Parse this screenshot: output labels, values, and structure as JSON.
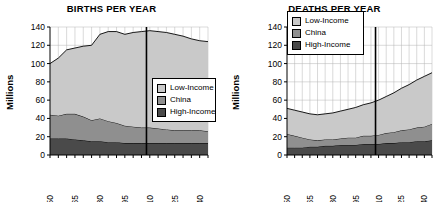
{
  "figure": {
    "width": 446,
    "height": 202,
    "background": "#ffffff"
  },
  "colors": {
    "low_income": "#c9c9c9",
    "china": "#8f8f8f",
    "high_income": "#4a4a4a",
    "axis": "#000000",
    "grid": "#b4b4b4",
    "marker_line": "#000000"
  },
  "chart_data": [
    {
      "type": "area",
      "stacked": true,
      "id": "births",
      "title": "BIRTHS PER YEAR",
      "xlabel": "",
      "ylabel": "Millions",
      "ylim": [
        0,
        140
      ],
      "yticks": [
        0,
        20,
        40,
        60,
        80,
        100,
        120,
        140
      ],
      "ytick_labels": [
        "0",
        "20",
        "40",
        "60",
        "80",
        "100",
        "120",
        "140"
      ],
      "xlim": [
        1950,
        2045
      ],
      "xticks": [
        1950,
        1965,
        1980,
        1995,
        2010,
        2025,
        2040
      ],
      "xtick_labels": [
        "1950",
        "1965",
        "1980",
        "1995",
        "2010",
        "2025",
        "2040"
      ],
      "minor_xtick_step": 5,
      "grid": true,
      "legend_position": "center-right",
      "marker_line_x": 2008,
      "x": [
        1950,
        1955,
        1960,
        1965,
        1970,
        1975,
        1980,
        1985,
        1990,
        1995,
        2000,
        2005,
        2010,
        2015,
        2020,
        2025,
        2030,
        2035,
        2040,
        2045
      ],
      "series": [
        {
          "name": "High-Income",
          "color": "#4a4a4a",
          "values": [
            18,
            18,
            18,
            17,
            16,
            15,
            15,
            14,
            14,
            13,
            13,
            13,
            13,
            13,
            13,
            13,
            13,
            13,
            13,
            13
          ]
        },
        {
          "name": "China",
          "color": "#8f8f8f",
          "values": [
            26,
            25,
            27,
            28,
            26,
            23,
            25,
            23,
            21,
            19,
            18,
            17,
            17,
            16,
            15,
            14,
            14,
            14,
            14,
            13
          ]
        },
        {
          "name": "Low-Income",
          "color": "#c9c9c9",
          "values": [
            56,
            63,
            70,
            72,
            77,
            82,
            92,
            98,
            100,
            100,
            103,
            105,
            106,
            106,
            106,
            105,
            103,
            100,
            98,
            98
          ]
        }
      ],
      "totals": [
        100,
        106,
        115,
        117,
        119,
        120,
        132,
        135,
        135,
        132,
        134,
        135,
        136,
        135,
        134,
        132,
        130,
        127,
        125,
        124
      ]
    },
    {
      "type": "area",
      "stacked": true,
      "id": "deaths",
      "title": "DEATHS PER YEAR",
      "xlabel": "",
      "ylabel": "Millions",
      "ylim": [
        0,
        140
      ],
      "yticks": [
        0,
        20,
        40,
        60,
        80,
        100,
        120,
        140
      ],
      "ytick_labels": [
        "0",
        "20",
        "40",
        "60",
        "80",
        "100",
        "120",
        "140"
      ],
      "xlim": [
        1950,
        2045
      ],
      "xticks": [
        1950,
        1965,
        1980,
        1995,
        2010,
        2025,
        2040
      ],
      "xtick_labels": [
        "1950",
        "1965",
        "1980",
        "1995",
        "2010",
        "2025",
        "2040"
      ],
      "minor_xtick_step": 5,
      "grid": true,
      "legend_position": "top-left",
      "marker_line_x": 2008,
      "x": [
        1950,
        1955,
        1960,
        1965,
        1970,
        1975,
        1980,
        1985,
        1990,
        1995,
        2000,
        2005,
        2010,
        2015,
        2020,
        2025,
        2030,
        2035,
        2040,
        2045
      ],
      "series": [
        {
          "name": "High-Income",
          "color": "#4a4a4a",
          "values": [
            8,
            8,
            8,
            9,
            9,
            10,
            10,
            11,
            11,
            11,
            12,
            12,
            12,
            13,
            13,
            14,
            14,
            15,
            15,
            16
          ]
        },
        {
          "name": "China",
          "color": "#8f8f8f",
          "values": [
            15,
            13,
            11,
            8,
            7,
            7,
            7,
            7,
            8,
            8,
            9,
            9,
            10,
            11,
            12,
            13,
            14,
            15,
            16,
            18
          ]
        },
        {
          "name": "Low-Income",
          "color": "#c9c9c9",
          "values": [
            28,
            28,
            28,
            28,
            28,
            28,
            29,
            30,
            31,
            33,
            34,
            36,
            38,
            40,
            43,
            46,
            49,
            52,
            55,
            56
          ]
        }
      ],
      "totals": [
        51,
        49,
        47,
        45,
        44,
        45,
        46,
        48,
        50,
        52,
        55,
        57,
        60,
        64,
        68,
        73,
        77,
        82,
        86,
        90
      ]
    }
  ],
  "legend": {
    "entries": [
      {
        "label": "Low-Income",
        "color": "#c9c9c9"
      },
      {
        "label": "China",
        "color": "#8f8f8f"
      },
      {
        "label": "High-Income",
        "color": "#4a4a4a"
      }
    ]
  }
}
